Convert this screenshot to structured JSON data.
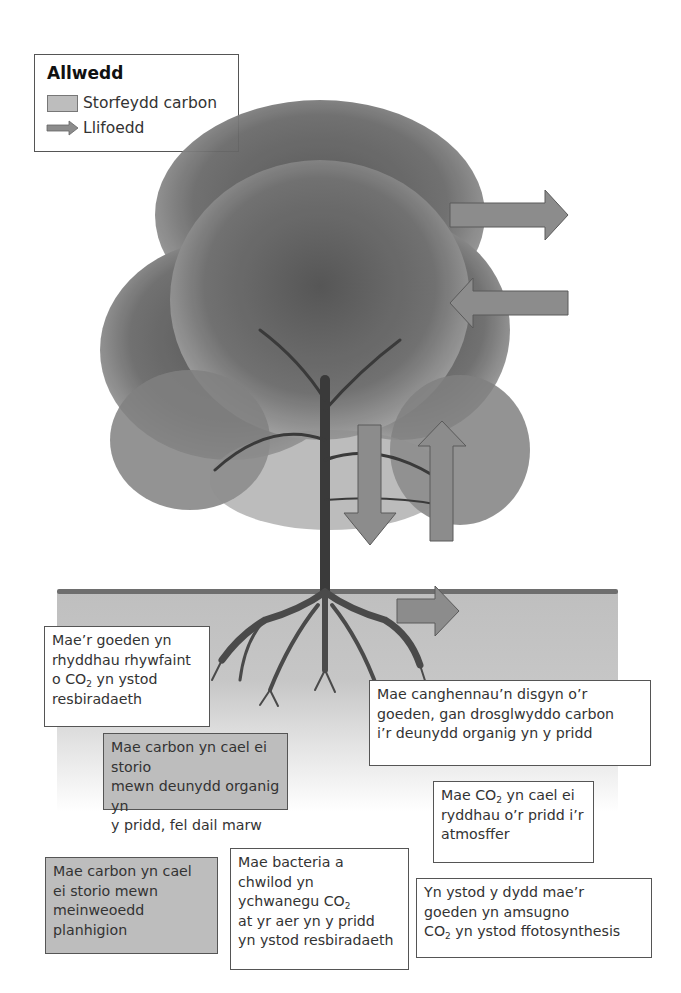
{
  "legend": {
    "title": "Allwedd",
    "items": [
      {
        "label": "Storfeydd carbon",
        "icon": "grey-shaded-box",
        "color": "#bdbdbd"
      },
      {
        "label": "Llifoedd",
        "icon": "arrow-right",
        "color": "#8c8c8c"
      }
    ]
  },
  "colors": {
    "store_fill": "#bdbdbd",
    "arrow_fill": "#8c8c8c",
    "soil": "#c4c4c4",
    "tree": "#4a4a4a",
    "border": "#555555"
  },
  "flows": [
    {
      "id": "canopy-out",
      "direction": "right"
    },
    {
      "id": "canopy-in",
      "direction": "left"
    },
    {
      "id": "tree-to-soil",
      "direction": "down"
    },
    {
      "id": "soil-to-air",
      "direction": "up"
    },
    {
      "id": "soil-right",
      "direction": "right"
    }
  ],
  "labels": {
    "tree_respiration": {
      "lines": [
        "Mae’r goeden yn",
        "rhyddhau rhywfaint",
        "o CO",
        "2",
        " yn ystod",
        "resbiradaeth"
      ],
      "type": "flow"
    },
    "organic_matter_store": {
      "text": "Mae carbon yn cael ei storio\nmewn deunydd organig yn\ny pridd, fel dail marw",
      "type": "store"
    },
    "branches_fall": {
      "text": "Mae canghennau’n disgyn o’r\ngoeden, gan drosglwyddo carbon\ni’r deunydd organig yn y pridd",
      "type": "flow"
    },
    "soil_release": {
      "pre": "Mae CO",
      "sub": "2",
      "post": " yn cael ei\nryddhau o’r pridd i’r\natmosffer",
      "type": "flow"
    },
    "plant_tissue_store": {
      "text": "Mae carbon yn cael\nei storio mewn\nmeinweoedd\nplanhigion",
      "type": "store"
    },
    "bacteria_respiration": {
      "pre": "Mae bacteria a\nchwilod yn\nychwanegu CO",
      "sub": "2",
      "post": "\nat yr aer yn y pridd\nyn ystod resbiradaeth",
      "type": "flow"
    },
    "photosynthesis": {
      "pre": "Yn ystod y dydd mae’r\ngoeden yn amsugno\nCO",
      "sub": "2",
      "post": " yn ystod ffotosynthesis",
      "type": "flow"
    }
  }
}
